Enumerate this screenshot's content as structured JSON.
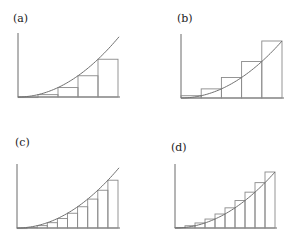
{
  "figure": {
    "panels": [
      {
        "id": "a",
        "label": "(a)",
        "label_pos": [
          13,
          22
        ],
        "origin": [
          18,
          97
        ],
        "width": 100,
        "height": 59,
        "curve_end_x": 119,
        "n": 5,
        "sum": "lower"
      },
      {
        "id": "b",
        "label": "(b)",
        "label_pos": [
          177,
          22
        ],
        "origin": [
          181,
          98
        ],
        "width": 101,
        "height": 57,
        "curve_end_x": 282,
        "n": 5,
        "sum": "upper"
      },
      {
        "id": "c",
        "label": "(c)",
        "label_pos": [
          15,
          146
        ],
        "origin": [
          17,
          228
        ],
        "width": 101,
        "height": 59,
        "curve_end_x": 119,
        "n": 10,
        "sum": "lower"
      },
      {
        "id": "d",
        "label": "(d)",
        "label_pos": [
          171,
          151
        ],
        "origin": [
          175,
          228
        ],
        "width": 100,
        "height": 56,
        "curve_end_x": 275,
        "n": 10,
        "sum": "upper"
      }
    ],
    "axis_top_offset": 64,
    "colors": {
      "axis": "#6a6a6a",
      "rect": "#8a8a8a",
      "curve": "#707070",
      "label": "#222222"
    }
  }
}
